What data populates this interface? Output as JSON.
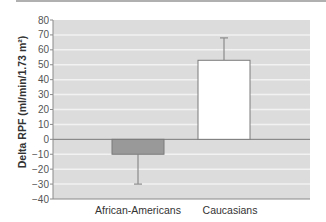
{
  "chart_data": {
    "type": "bar",
    "title": "",
    "xlabel": "",
    "ylabel": "Delta RPF (ml/min/1.73 m²)",
    "ylim": [
      -40,
      80
    ],
    "yticks": [
      80,
      70,
      60,
      50,
      40,
      30,
      20,
      10,
      0,
      -10,
      -20,
      -30,
      -40
    ],
    "grid": true,
    "categories": [
      "African-Americans",
      "Caucasians"
    ],
    "values": [
      -10,
      53
    ],
    "error_bars": [
      {
        "direction": "down",
        "extent": -30
      },
      {
        "direction": "up",
        "extent": 68
      }
    ],
    "bar_colors": [
      "#999999",
      "#ffffff"
    ],
    "background_color": "#dcdcdc"
  }
}
